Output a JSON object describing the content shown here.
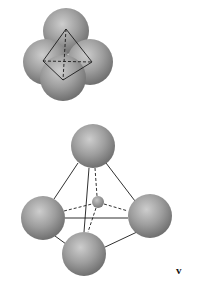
{
  "figure": {
    "label": "v",
    "colors": {
      "sphere_light": "#c8c8c8",
      "sphere_mid": "#9a9a9a",
      "sphere_dark": "#6e6e6e",
      "line": "#1a1a1a",
      "background": "#ffffff"
    },
    "top_cluster": {
      "description": "four close-packed spheres with tetrahedron outline",
      "spheres": [
        {
          "name": "back",
          "cx": 66,
          "cy": 31,
          "r": 23
        },
        {
          "name": "left",
          "cx": 46,
          "cy": 62,
          "r": 23
        },
        {
          "name": "right",
          "cx": 90,
          "cy": 62,
          "r": 23
        },
        {
          "name": "front",
          "cx": 63,
          "cy": 78,
          "r": 23
        }
      ]
    },
    "bottom_tetrahedron": {
      "description": "expanded tetrahedral arrangement with small interstitial sphere",
      "spheres": [
        {
          "name": "top",
          "cx": 93,
          "cy": 146,
          "r": 22
        },
        {
          "name": "left",
          "cx": 43,
          "cy": 218,
          "r": 22
        },
        {
          "name": "right",
          "cx": 150,
          "cy": 216,
          "r": 22
        },
        {
          "name": "bottom",
          "cx": 84,
          "cy": 254,
          "r": 22
        }
      ],
      "void_sphere": {
        "cx": 98,
        "cy": 202,
        "r": 6
      }
    }
  }
}
